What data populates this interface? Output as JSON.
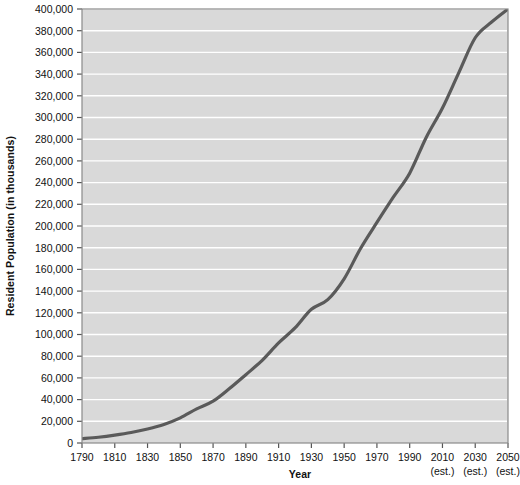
{
  "chart_data": {
    "type": "line",
    "title": "",
    "xlabel": "Year",
    "ylabel": "Resident Population (in thousands)",
    "xlim": [
      1790,
      2050
    ],
    "ylim": [
      0,
      400000
    ],
    "grid": true,
    "legend": "none",
    "line_color": "#5a5a5a",
    "plot_background": "#d9d9d9",
    "gridline_color": "#ffffff",
    "axis_color": "#7a7a7a",
    "x_tick_labels": [
      {
        "label": "1790",
        "sub": ""
      },
      {
        "label": "1810",
        "sub": ""
      },
      {
        "label": "1830",
        "sub": ""
      },
      {
        "label": "1850",
        "sub": ""
      },
      {
        "label": "1870",
        "sub": ""
      },
      {
        "label": "1890",
        "sub": ""
      },
      {
        "label": "1910",
        "sub": ""
      },
      {
        "label": "1930",
        "sub": ""
      },
      {
        "label": "1950",
        "sub": ""
      },
      {
        "label": "1970",
        "sub": ""
      },
      {
        "label": "1990",
        "sub": ""
      },
      {
        "label": "2010",
        "sub": "(est.)"
      },
      {
        "label": "2030",
        "sub": "(est.)"
      },
      {
        "label": "2050",
        "sub": "(est.)"
      }
    ],
    "y_tick_labels": [
      "0",
      "20,000",
      "40,000",
      "60,000",
      "80,000",
      "100,000",
      "120,000",
      "140,000",
      "160,000",
      "180,000",
      "200,000",
      "220,000",
      "240,000",
      "260,000",
      "280,000",
      "300,000",
      "320,000",
      "340,000",
      "360,000",
      "380,000",
      "400,000"
    ],
    "y_tick_values": [
      0,
      20000,
      40000,
      60000,
      80000,
      100000,
      120000,
      140000,
      160000,
      180000,
      200000,
      220000,
      240000,
      260000,
      280000,
      300000,
      320000,
      340000,
      360000,
      380000,
      400000
    ],
    "x": [
      1790,
      1800,
      1810,
      1820,
      1830,
      1840,
      1850,
      1860,
      1870,
      1880,
      1890,
      1900,
      1910,
      1920,
      1930,
      1940,
      1950,
      1960,
      1970,
      1980,
      1990,
      2000,
      2010,
      2020,
      2030,
      2040,
      2050
    ],
    "values": [
      3929,
      5308,
      7240,
      9638,
      12866,
      17069,
      23192,
      31443,
      38558,
      50189,
      62980,
      76212,
      92228,
      106022,
      123203,
      132165,
      151326,
      179323,
      203302,
      226542,
      248710,
      281422,
      308746,
      341387,
      373504,
      388000,
      400000
    ],
    "series_name": "Resident Population"
  }
}
